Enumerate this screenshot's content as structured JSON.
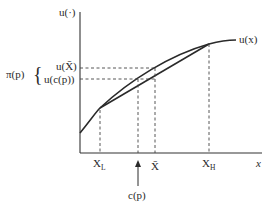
{
  "diagram": {
    "type": "expected-utility-risk-premium",
    "y_axis_label": "u(·)",
    "x_axis_label": "x",
    "curve_label": "u(x)",
    "y_labels": {
      "u_xbar": "u(X̄)",
      "u_cp": "u(c(p))"
    },
    "bracket_label": "π(p)",
    "bracket_symbol": "{",
    "x_ticks": {
      "xl_main": "X",
      "xl_sub": "L",
      "xbar": "X̄",
      "xh_main": "X",
      "xh_sub": "H"
    },
    "arrow_label": "c(p)",
    "colors": {
      "line": "#2a2a2a",
      "background": "#ffffff"
    }
  }
}
